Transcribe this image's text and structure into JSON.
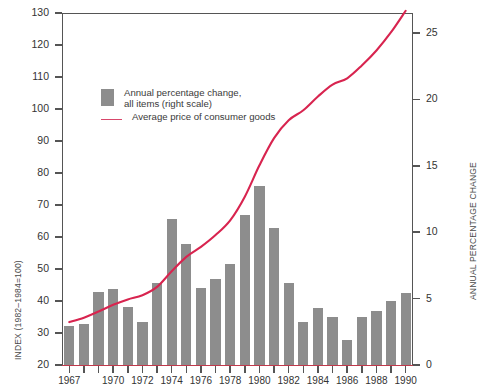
{
  "chart_data": {
    "type": "bar",
    "title": "",
    "subtitle": "",
    "xlabel": "",
    "ylabel": "INDEX (1982–1984=100)",
    "y2label": "ANNUAL PERCENTAGE CHANGE",
    "grid": false,
    "legend_position": "upper-left-inside",
    "ylim": [
      20,
      130
    ],
    "yticks": [
      20,
      30,
      40,
      50,
      60,
      70,
      80,
      90,
      100,
      110,
      120,
      130
    ],
    "y2lim": [
      0,
      26.5
    ],
    "y2ticks": [
      0,
      5,
      10,
      15,
      20,
      25
    ],
    "categories": [
      1967,
      1968,
      1969,
      1970,
      1971,
      1972,
      1973,
      1974,
      1975,
      1976,
      1977,
      1978,
      1979,
      1980,
      1981,
      1982,
      1983,
      1984,
      1985,
      1986,
      1987,
      1988,
      1989,
      1990
    ],
    "xtick_labels": [
      "1967",
      "",
      "",
      "1970",
      "",
      "1972",
      "",
      "1974",
      "",
      "1976",
      "",
      "1978",
      "",
      "1980",
      "",
      "1982",
      "",
      "1984",
      "",
      "1986",
      "",
      "1988",
      "",
      "1990"
    ],
    "series": [
      {
        "name": "Annual percentage change, all items (right scale)",
        "type": "bar",
        "axis": "right",
        "color": "#8d8d8d",
        "values": [
          2.9,
          3.1,
          5.5,
          5.7,
          4.4,
          3.2,
          6.2,
          11.0,
          9.1,
          5.8,
          6.5,
          7.6,
          11.3,
          13.5,
          10.3,
          6.2,
          3.2,
          4.3,
          3.6,
          1.9,
          3.6,
          4.1,
          4.8,
          5.4
        ]
      },
      {
        "name": "Average price of consumer goods",
        "type": "line",
        "axis": "left",
        "color": "#d8244f",
        "values": [
          33.4,
          34.8,
          36.7,
          38.8,
          40.5,
          41.8,
          44.4,
          49.3,
          53.8,
          56.9,
          60.6,
          65.2,
          72.6,
          82.4,
          90.9,
          96.5,
          99.6,
          103.9,
          107.6,
          109.6,
          113.6,
          118.3,
          124.0,
          130.7
        ]
      }
    ],
    "legend": [
      {
        "marker": "bar-swatch",
        "label": "Annual percentage change,\nall items (right scale)",
        "color": "#8d8d8d"
      },
      {
        "marker": "line-swatch",
        "label": "Average price of consumer goods",
        "color": "#d8476b"
      }
    ]
  },
  "layout": {
    "plot_left": 62,
    "plot_right": 413,
    "plot_top": 13,
    "plot_bottom": 365
  }
}
